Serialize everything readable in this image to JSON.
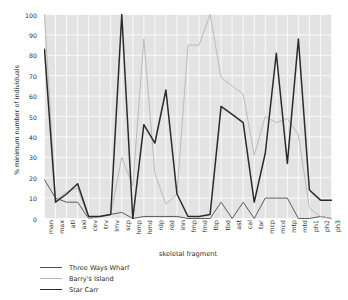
{
  "chart_data": {
    "type": "line",
    "title": "",
    "xlabel": "skeletal fragment",
    "ylabel": "% minimum number of individuals",
    "ylim": [
      0,
      100
    ],
    "ytick_labels": [
      "0",
      "10",
      "20",
      "30",
      "40",
      "50",
      "60",
      "70",
      "80",
      "90",
      "100"
    ],
    "ytick_values": [
      0,
      10,
      20,
      30,
      40,
      50,
      60,
      70,
      80,
      90,
      100
    ],
    "grid": true,
    "legend_position": "below-left",
    "categories": [
      "man",
      "max",
      "atl",
      "axi",
      "cev",
      "trv",
      "lmv",
      "scp",
      "hmp",
      "hmd",
      "rdp",
      "rdd",
      "inn",
      "fmp",
      "fmd",
      "tbp",
      "tbd",
      "ast",
      "cal",
      "tar",
      "mcp",
      "mcd",
      "mtp",
      "mtd",
      "ph1",
      "ph2",
      "ph3"
    ],
    "series": [
      {
        "name": "Three Ways Wharf",
        "color": "#4d4d4d",
        "width": 0.9,
        "values": [
          19,
          10,
          8,
          8,
          0,
          1,
          2,
          3,
          0,
          1,
          1,
          1,
          1,
          0,
          0,
          0,
          8,
          0,
          8,
          0,
          10,
          10,
          10,
          0,
          0,
          1,
          0
        ]
      },
      {
        "name": "Barry's Island",
        "color": "#b5b5b5",
        "width": 0.9,
        "values": [
          100,
          9,
          13,
          15,
          0,
          1,
          2,
          30,
          16,
          88,
          22,
          7,
          12,
          85,
          85,
          100,
          69,
          65,
          61,
          31,
          50,
          47,
          49,
          41,
          5,
          1,
          0
        ]
      },
      {
        "name": "Star Carr",
        "color": "#2b2b2b",
        "width": 1.5,
        "values": [
          83,
          8,
          12,
          17,
          1,
          1,
          2,
          100,
          0,
          46,
          37,
          63,
          12,
          1,
          1,
          2,
          55,
          51,
          47,
          8,
          32,
          81,
          27,
          88,
          14,
          9,
          9
        ]
      }
    ]
  },
  "legend": {
    "items": [
      {
        "label": "Three Ways Wharf",
        "color": "#4d4d4d",
        "width": 0.9
      },
      {
        "label": "Barry's Island",
        "color": "#b5b5b5",
        "width": 0.9
      },
      {
        "label": "Star Carr",
        "color": "#2b2b2b",
        "width": 1.5
      }
    ]
  },
  "style": {
    "plot_background": "#e3e3e3",
    "grid_color": "#ffffff",
    "figure_background": "#ffffff",
    "text_color": "#2b2b2b"
  }
}
